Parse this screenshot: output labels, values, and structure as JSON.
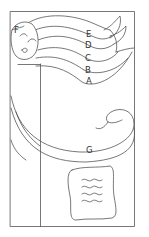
{
  "diagram": {
    "type": "pattern-template",
    "colors": {
      "line": "#555555",
      "background": "#ffffff",
      "label": "#333333"
    },
    "labels": [
      {
        "id": "A",
        "text": "A",
        "x": 86,
        "y": 84
      },
      {
        "id": "B",
        "text": "B",
        "x": 85,
        "y": 73
      },
      {
        "id": "C",
        "text": "C",
        "x": 85,
        "y": 61
      },
      {
        "id": "D",
        "text": "D",
        "x": 85,
        "y": 48
      },
      {
        "id": "E",
        "text": "E",
        "x": 86,
        "y": 37
      },
      {
        "id": "F",
        "text": "F",
        "x": 14,
        "y": 33
      },
      {
        "id": "G",
        "text": "G",
        "x": 86,
        "y": 153
      }
    ],
    "regions": [
      {
        "id": "A",
        "description": "lowest wave band"
      },
      {
        "id": "B",
        "description": "second wave band"
      },
      {
        "id": "C",
        "description": "third wave band"
      },
      {
        "id": "D",
        "description": "fourth wave band"
      },
      {
        "id": "E",
        "description": "top wave band"
      },
      {
        "id": "F",
        "description": "moon face"
      },
      {
        "id": "G",
        "description": "curling swirl band"
      }
    ]
  }
}
